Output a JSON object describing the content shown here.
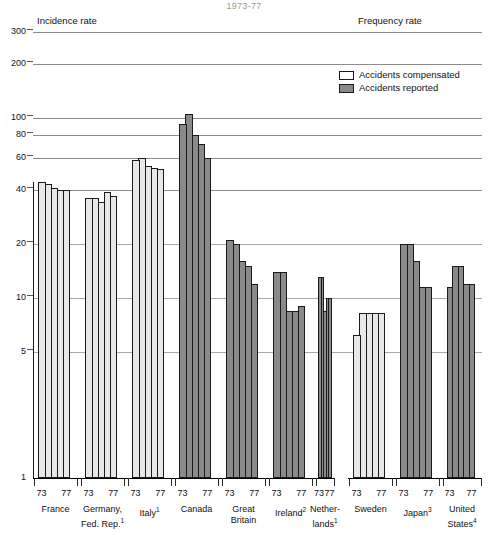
{
  "title": "1973-77",
  "panels": {
    "left_label": "Incidence rate",
    "right_label": "Frequency rate"
  },
  "legend": {
    "position": "top-right",
    "items": [
      {
        "label": "Accidents compensated",
        "swatch": "light",
        "color": "#ffffff"
      },
      {
        "label": "Accidents reported",
        "swatch": "dark",
        "color": "#8a8a8a"
      }
    ]
  },
  "axis": {
    "y_scale": "log",
    "y_ticks": [
      "300",
      "200",
      "100",
      "80",
      "60",
      "40",
      "20",
      "10",
      "5",
      "1"
    ],
    "y_min": 1,
    "y_max": 300,
    "x_year_start": "73",
    "x_year_end": "77"
  },
  "chart_data": {
    "type": "bar",
    "title": "1973-77",
    "xlabel": "",
    "ylabel": "",
    "ylim": [
      1,
      300
    ],
    "yscale": "log",
    "grid": true,
    "legend_position": "top-right",
    "ytick_values": [
      300,
      200,
      100,
      80,
      60,
      40,
      20,
      10,
      5,
      1
    ],
    "categories": [
      "France",
      "Germany, Fed. Rep.",
      "Italy",
      "Canada",
      "Great Britain",
      "Ireland",
      "Netherlands",
      "Sweden",
      "Japan",
      "United States"
    ],
    "series": [
      {
        "name": "Accidents compensated",
        "fill": "light",
        "countries": [
          {
            "country": "France",
            "footnote": "",
            "years": [
              "73",
              "74",
              "75",
              "76",
              "77"
            ],
            "values": [
              44,
              43,
              41,
              40,
              40
            ]
          },
          {
            "country": "Germany, Fed. Rep.",
            "footnote": "1",
            "years": [
              "73",
              "74",
              "75",
              "76",
              "77"
            ],
            "values": [
              36,
              36,
              34,
              39,
              37
            ]
          },
          {
            "country": "Italy",
            "footnote": "1",
            "years": [
              "73",
              "74",
              "75",
              "76",
              "77"
            ],
            "values": [
              58,
              60,
              54,
              53,
              52
            ]
          }
        ]
      },
      {
        "name": "Accidents reported",
        "fill": "dark",
        "countries": [
          {
            "country": "Canada",
            "footnote": "",
            "years": [
              "73",
              "74",
              "75",
              "76",
              "77"
            ],
            "values": [
              92,
              105,
              80,
              72,
              60
            ]
          },
          {
            "country": "Great Britain",
            "footnote": "",
            "years": [
              "73",
              "74",
              "75",
              "76",
              "77"
            ],
            "values": [
              21,
              20,
              16,
              15,
              12
            ]
          },
          {
            "country": "Ireland",
            "footnote": "2",
            "years": [
              "73",
              "74",
              "75",
              "76",
              "77"
            ],
            "values": [
              14,
              14,
              8.5,
              8.5,
              9
            ]
          },
          {
            "country": "Netherlands",
            "footnote": "1",
            "years": [
              "73",
              "74",
              "75",
              "76",
              "77"
            ],
            "values": [
              13,
              13,
              8.5,
              10,
              10
            ]
          }
        ]
      },
      {
        "name": "Accidents compensated (frequency panel)",
        "fill": "light",
        "countries": [
          {
            "country": "Sweden",
            "footnote": "",
            "years": [
              "73",
              "74",
              "75",
              "76",
              "77"
            ],
            "values": [
              6.2,
              8.3,
              8.3,
              8.3,
              8.3
            ]
          }
        ]
      },
      {
        "name": "Accidents reported (frequency panel)",
        "fill": "dark",
        "countries": [
          {
            "country": "Japan",
            "footnote": "3",
            "years": [
              "73",
              "74",
              "75",
              "76",
              "77"
            ],
            "values": [
              20,
              20,
              16,
              11.5,
              11.5
            ]
          },
          {
            "country": "United States",
            "footnote": "4",
            "years": [
              "73",
              "74",
              "75",
              "76",
              "77"
            ],
            "values": [
              11.5,
              15,
              15,
              12,
              12
            ]
          }
        ]
      }
    ]
  },
  "x_axis_groups": [
    {
      "country": "Netherlands-wrap",
      "line1": "",
      "line2": ""
    }
  ],
  "countries": [
    {
      "key": "france",
      "line1": "France",
      "line2": "",
      "footnote": "",
      "fill": "light",
      "panel": "left",
      "values": [
        44,
        43,
        41,
        40,
        40
      ]
    },
    {
      "key": "germany",
      "line1": "Germany,",
      "line2": "Fed. Rep.",
      "footnote": "1",
      "fill": "light",
      "panel": "left",
      "values": [
        36,
        36,
        34,
        39,
        37
      ]
    },
    {
      "key": "italy",
      "line1": "Italy",
      "line2": "",
      "footnote": "1",
      "fill": "light",
      "panel": "left",
      "values": [
        58,
        60,
        54,
        53,
        52
      ]
    },
    {
      "key": "canada",
      "line1": "Canada",
      "line2": "",
      "footnote": "",
      "fill": "dark",
      "panel": "left",
      "values": [
        92,
        105,
        80,
        72,
        60
      ]
    },
    {
      "key": "great-britain",
      "line1": "Great",
      "line2": "Britain",
      "footnote": "",
      "fill": "dark",
      "panel": "left",
      "values": [
        21,
        20,
        16,
        15,
        12
      ]
    },
    {
      "key": "ireland",
      "line1": "Ireland",
      "line2": "",
      "footnote": "2",
      "fill": "dark",
      "panel": "left",
      "values": [
        14,
        14,
        8.5,
        8.5,
        9
      ]
    },
    {
      "key": "netherlands",
      "line1": "Nether-",
      "line2": "lands",
      "footnote": "1",
      "fill": "dark",
      "panel": "left",
      "values": [
        13,
        13,
        8.5,
        10,
        10
      ]
    },
    {
      "key": "sweden",
      "line1": "Sweden",
      "line2": "",
      "footnote": "",
      "fill": "light",
      "panel": "right",
      "values": [
        6.2,
        8.3,
        8.3,
        8.3,
        8.3
      ]
    },
    {
      "key": "japan",
      "line1": "Japan",
      "line2": "",
      "footnote": "3",
      "fill": "dark",
      "panel": "right",
      "values": [
        20,
        20,
        16,
        11.5,
        11.5
      ]
    },
    {
      "key": "united-states",
      "line1": "United",
      "line2": "States",
      "footnote": "4",
      "fill": "dark",
      "panel": "right",
      "values": [
        11.5,
        15,
        15,
        12,
        12
      ]
    }
  ]
}
